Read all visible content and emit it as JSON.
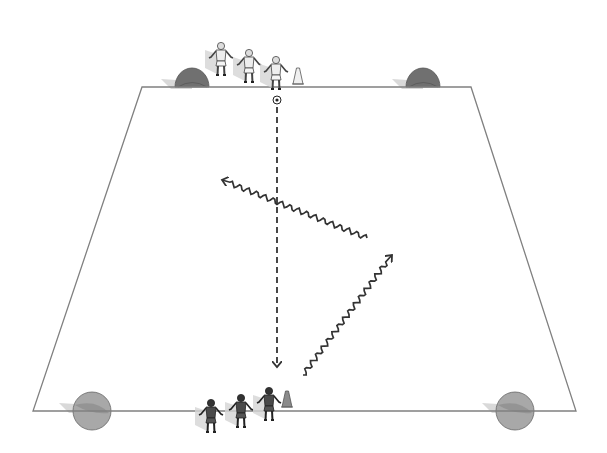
{
  "diagram": {
    "type": "soccer-drill",
    "colors": {
      "field_line": "#808080",
      "arrow": "#333333",
      "cone_light": "#f0f0f0",
      "cone_dark": "#8a8a8a",
      "goal_dark": "#707070",
      "goal_light": "#a8a8a8",
      "player_light": "#eeeeee",
      "player_dark": "#4a4a4a"
    },
    "field": {
      "top_left": [
        142,
        87
      ],
      "top_right": [
        471,
        87
      ],
      "bottom_right": [
        576,
        411
      ],
      "bottom_left": [
        33,
        411
      ]
    },
    "goals": [
      {
        "id": "top-left-goal",
        "x": 192,
        "y": 87,
        "r": 17,
        "style": "dark"
      },
      {
        "id": "top-right-goal",
        "x": 423,
        "y": 87,
        "r": 17,
        "style": "dark"
      },
      {
        "id": "bottom-left-goal",
        "x": 92,
        "y": 411,
        "r": 19,
        "style": "light"
      },
      {
        "id": "bottom-right-goal",
        "x": 515,
        "y": 411,
        "r": 19,
        "style": "light"
      }
    ],
    "team_top": {
      "label": "white team",
      "players": [
        {
          "x": 221,
          "y": 48
        },
        {
          "x": 249,
          "y": 55
        },
        {
          "x": 276,
          "y": 62
        }
      ],
      "cone": {
        "x": 298,
        "y": 84
      }
    },
    "team_bottom": {
      "label": "dark team",
      "players": [
        {
          "x": 211,
          "y": 405
        },
        {
          "x": 241,
          "y": 400
        },
        {
          "x": 269,
          "y": 393
        }
      ],
      "cone": {
        "x": 287,
        "y": 407
      }
    },
    "ball": {
      "x": 277,
      "y": 100
    },
    "pass": {
      "style": "dashed",
      "from": [
        277,
        107
      ],
      "to": [
        277,
        367
      ]
    },
    "runs": [
      {
        "id": "run-left",
        "style": "wavy",
        "from": [
          367,
          238
        ],
        "to": [
          222,
          180
        ]
      },
      {
        "id": "run-right",
        "style": "wavy",
        "from": [
          303,
          375
        ],
        "to": [
          392,
          255
        ]
      }
    ]
  }
}
